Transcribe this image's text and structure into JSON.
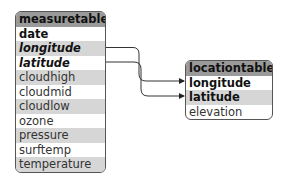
{
  "measure_table": {
    "name": "measure",
    "kind": "table",
    "fields": [
      {
        "label": "date",
        "style": "bold"
      },
      {
        "label": "longitude",
        "style": "bold-italic"
      },
      {
        "label": "latitude",
        "style": "bold-italic"
      },
      {
        "label": "cloudhigh",
        "style": "normal"
      },
      {
        "label": "cloudmid",
        "style": "normal"
      },
      {
        "label": "cloudlow",
        "style": "normal"
      },
      {
        "label": "ozone",
        "style": "normal"
      },
      {
        "label": "pressure",
        "style": "normal"
      },
      {
        "label": "surftemp",
        "style": "normal"
      },
      {
        "label": "temperature",
        "style": "normal"
      }
    ]
  },
  "location_table": {
    "name": "location",
    "kind": "table",
    "fields": [
      {
        "label": "longitude",
        "style": "bold"
      },
      {
        "label": "latitude",
        "style": "bold"
      },
      {
        "label": "elevation",
        "style": "normal"
      }
    ]
  },
  "relations": [
    {
      "from": "measure.longitude",
      "to": "location.longitude"
    },
    {
      "from": "measure.latitude",
      "to": "location.latitude"
    }
  ],
  "colors": {
    "header_bg": "#9a9a9a",
    "alt_row_bg": "#d6d6d6",
    "border": "#555555"
  }
}
